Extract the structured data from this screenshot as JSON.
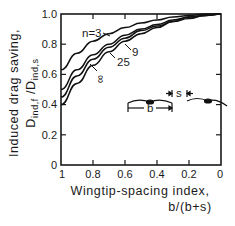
{
  "chart_data": {
    "type": "line",
    "title": "",
    "xlabel": "Wingtip-spacing index, b/(b+s)",
    "xlabel_line1": "Wingtip-spacing index,",
    "xlabel_line2": "b/(b+s)",
    "ylabel_line1": "Induced drag saving,",
    "ylabel_line2_main": "D",
    "ylabel_line2_sub1": "ind,f",
    "ylabel_line2_sep": " /D",
    "ylabel_line2_sub2": "ind,s",
    "x": [
      1.0,
      0.9,
      0.8,
      0.7,
      0.6,
      0.5,
      0.4,
      0.3,
      0.2,
      0.1,
      0.0
    ],
    "xlim": [
      1.0,
      0.0
    ],
    "ylim": [
      0.0,
      1.0
    ],
    "x_ticks": [
      "1",
      "0.8",
      "0.6",
      "0.4",
      "0.2",
      "0"
    ],
    "y_ticks": [
      "0",
      "0.2",
      "0.4",
      "0.6",
      "0.8",
      "1.0"
    ],
    "grid": false,
    "series": [
      {
        "name": "n=3",
        "label": "n=3",
        "values": [
          0.63,
          0.74,
          0.82,
          0.87,
          0.91,
          0.94,
          0.96,
          0.98,
          0.99,
          1.0,
          1.0
        ]
      },
      {
        "name": "9",
        "label": "9",
        "values": [
          0.5,
          0.63,
          0.73,
          0.8,
          0.86,
          0.9,
          0.93,
          0.96,
          0.98,
          0.99,
          1.0
        ]
      },
      {
        "name": "25",
        "label": "25",
        "values": [
          0.45,
          0.59,
          0.7,
          0.78,
          0.84,
          0.89,
          0.92,
          0.95,
          0.98,
          0.99,
          1.0
        ]
      },
      {
        "name": "infinity",
        "label": "∞",
        "values": [
          0.4,
          0.54,
          0.66,
          0.75,
          0.82,
          0.87,
          0.91,
          0.95,
          0.97,
          0.99,
          1.0
        ]
      }
    ],
    "inset": {
      "b_label": "b",
      "s_label": "s",
      "description": "two birds in line abreast, span b, tip spacing s"
    }
  }
}
